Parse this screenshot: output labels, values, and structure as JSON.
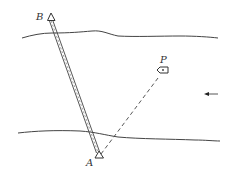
{
  "diagram": {
    "labels": {
      "B": "B",
      "P": "P",
      "A": "A"
    },
    "elements": {
      "top_bank": "river bank (upper)",
      "bottom_bank": "river bank (lower)",
      "line_AB": "double line from A to B",
      "line_AP": "dashed line from A to P",
      "boat": "boat at P",
      "current_arrow": "arrow pointing left (water flow)"
    },
    "colors": {
      "stroke": "#333333",
      "background": "#ffffff"
    }
  }
}
